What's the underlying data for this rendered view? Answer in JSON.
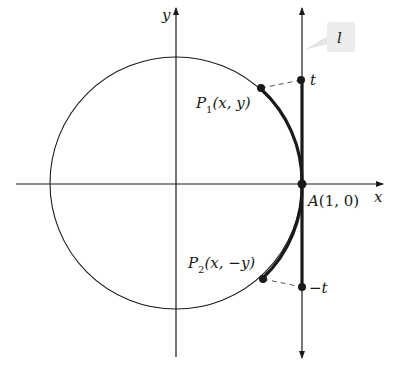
{
  "diagram": {
    "type": "unit-circle-tangent-line",
    "colors": {
      "background": "#ffffff",
      "stroke": "#1a1a1a",
      "dashed": "#555555",
      "callout_fill": "#ececec"
    },
    "axes": {
      "x_label": "x",
      "y_label": "y"
    },
    "line_label": "l",
    "points": {
      "P1": {
        "name": "P",
        "sub": "1",
        "coords": "(x, y)"
      },
      "P2": {
        "name": "P",
        "sub": "2",
        "coords": "(x, −y)"
      },
      "A": {
        "label": "A",
        "coords": "(1, 0)"
      },
      "t_top": {
        "label": "t"
      },
      "t_bottom": {
        "label": "−t"
      }
    }
  }
}
